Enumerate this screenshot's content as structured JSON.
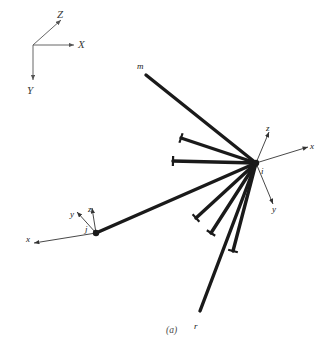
{
  "figure": {
    "caption": "(a)",
    "background_color": "#ffffff",
    "member_color": "#1a1a1a",
    "axis_color": "#555555",
    "label_color": "#1a1a1a"
  },
  "global_axes": {
    "origin": [
      33,
      45
    ],
    "labels": {
      "x": "X",
      "y": "Y",
      "z": "Z"
    },
    "x_end": [
      74,
      45
    ],
    "y_end": [
      33,
      80
    ],
    "z_end": [
      61,
      20
    ],
    "x_label_pos": [
      78,
      39
    ],
    "y_label_pos": [
      27,
      85
    ],
    "z_label_pos": [
      57,
      9
    ]
  },
  "nodes": [
    {
      "id": "node-i",
      "label": "i",
      "label_pos": [
        261,
        167
      ],
      "position": [
        256,
        163
      ],
      "local_axes": {
        "labels": {
          "x": "x",
          "y": "y",
          "z": "z"
        },
        "x_end": [
          308,
          147
        ],
        "y_end": [
          273,
          204
        ],
        "z_end": [
          269,
          132
        ],
        "x_label_pos": [
          310,
          142
        ],
        "y_label_pos": [
          272,
          205
        ],
        "z_label_pos": [
          266,
          124
        ]
      }
    },
    {
      "id": "node-j",
      "label": "j",
      "label_pos": [
        85,
        225
      ],
      "position": [
        96,
        233
      ],
      "local_axes": {
        "labels": {
          "x": "x",
          "y": "y",
          "z": "z"
        },
        "x_end": [
          34,
          243
        ],
        "y_end": [
          77,
          212
        ],
        "z_end": [
          92,
          208
        ],
        "x_label_pos": [
          26,
          235
        ],
        "y_label_pos": [
          70,
          210
        ],
        "z_label_pos": [
          88,
          205
        ]
      }
    }
  ],
  "members": [
    {
      "id": "member-m",
      "from": [
        256,
        163
      ],
      "to": [
        146,
        75
      ],
      "end_label": "m",
      "end_label_pos": [
        137,
        62
      ],
      "end_cap": false
    },
    {
      "id": "member-2",
      "from": [
        256,
        163
      ],
      "to": [
        181,
        138
      ],
      "end_label": "",
      "end_label_pos": [
        0,
        0
      ],
      "end_cap": true
    },
    {
      "id": "member-3",
      "from": [
        256,
        163
      ],
      "to": [
        173,
        161
      ],
      "end_label": "",
      "end_label_pos": [
        0,
        0
      ],
      "end_cap": true
    },
    {
      "id": "member-j",
      "from": [
        256,
        163
      ],
      "to": [
        96,
        233
      ],
      "end_label": "",
      "end_label_pos": [
        0,
        0
      ],
      "end_cap": false
    },
    {
      "id": "member-5",
      "from": [
        256,
        163
      ],
      "to": [
        196,
        218
      ],
      "end_label": "",
      "end_label_pos": [
        0,
        0
      ],
      "end_cap": true
    },
    {
      "id": "member-6",
      "from": [
        256,
        163
      ],
      "to": [
        211,
        233
      ],
      "end_label": "",
      "end_label_pos": [
        0,
        0
      ],
      "end_cap": true
    },
    {
      "id": "member-7",
      "from": [
        256,
        163
      ],
      "to": [
        233,
        251
      ],
      "end_label": "",
      "end_label_pos": [
        0,
        0
      ],
      "end_cap": true
    },
    {
      "id": "member-r",
      "from": [
        256,
        163
      ],
      "to": [
        200,
        311
      ],
      "end_label": "r",
      "end_label_pos": [
        194,
        322
      ],
      "end_cap": false
    }
  ],
  "caption_pos": [
    166,
    326
  ]
}
